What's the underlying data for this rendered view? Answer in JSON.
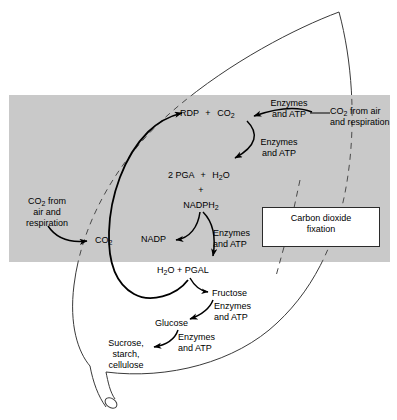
{
  "diagram": {
    "leaf_fill": "#ffffff",
    "leaf_stroke": "#3a3a3a",
    "chloroplast_band_fill": "#c9c9c9",
    "arrow_color": "#000000",
    "dashed_color": "#4a4a4a"
  },
  "callouts": {
    "fixation_box_line1": "Carbon dioxide",
    "fixation_box_line2": "fixation"
  },
  "inputs": {
    "co2_right_line1": "CO",
    "co2_right_sub": "2",
    "co2_right_line1_rest": " from air",
    "co2_right_line2": "and respiration",
    "co2_left_line1": "CO",
    "co2_left_sub": "2",
    "co2_left_line1_rest": " from",
    "co2_left_line2": "air and",
    "co2_left_line3": "respiration",
    "co2_left_node": "CO",
    "co2_left_node_sub": "2"
  },
  "molecules": {
    "rdp": "RDP",
    "plus_1": "+",
    "co2_cycle": "CO",
    "co2_cycle_sub": "2",
    "pga": "2 PGA",
    "plus_2": "+",
    "h2o_1": "H",
    "h2o_1_sub": "2",
    "h2o_1_rest": "O",
    "plus_3": "+",
    "nadph2": "NADPH",
    "nadph2_sub": "2",
    "nadp": "NADP",
    "h2o_2": "H",
    "h2o_2_sub": "2",
    "h2o_2_rest": "O + PGAL",
    "fructose": "Fructose",
    "glucose": "Glucose",
    "products_line1": "Sucrose,",
    "products_line2": "starch,",
    "products_line3": "cellulose"
  },
  "enzyme_labels": {
    "e1_line1": "Enzymes",
    "e1_line2": "and ATP",
    "e2_line1": "Enzymes",
    "e2_line2": "and ATP",
    "e3_line1": "Enzymes",
    "e3_line2": "and ATP",
    "e4_line1": "Enzymes",
    "e4_line2": "and ATP",
    "e5_line1": "Enzymes",
    "e5_line2": "and ATP"
  }
}
